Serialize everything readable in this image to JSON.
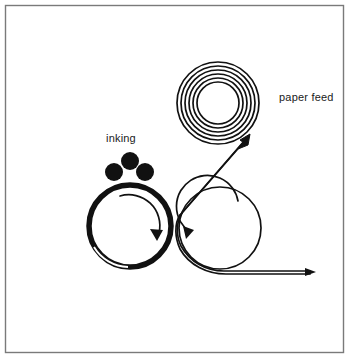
{
  "figure": {
    "background_color": "#ffffff",
    "ink_color": "#111111",
    "border": {
      "name": "figure-border",
      "color": "#7a7a7a",
      "inset_px": 5,
      "stroke_width": 1.4
    }
  },
  "labels": {
    "inking": "inking",
    "paper_feed": "paper feed"
  },
  "label_positions": {
    "inking": {
      "x": 106,
      "y": 142
    },
    "paper_feed": {
      "x": 279,
      "y": 101
    }
  },
  "components": {
    "paper_roll": {
      "name": "paper-roll",
      "center": {
        "x": 218,
        "y": 103
      },
      "outer_radius": 41,
      "inner_radius": 21,
      "turns": 6,
      "stroke_width": 1.6,
      "color": "#111111"
    },
    "plate_cylinder": {
      "name": "plate-cylinder",
      "center": {
        "x": 130,
        "y": 226
      },
      "radius": 41,
      "stroke_width": 5.5,
      "color": "#111111",
      "gap_sliver": {
        "start_deg": 150,
        "end_deg": 186
      }
    },
    "impression_cylinder": {
      "name": "impression-cylinder",
      "center": {
        "x": 220,
        "y": 228
      },
      "radius": 41,
      "stroke_width": 1.6,
      "color": "#111111"
    },
    "inking_rollers": {
      "name": "inking-rollers",
      "color": "#111111",
      "rollers": [
        {
          "label": "top-roller",
          "cx": 130,
          "cy": 161,
          "r": 9
        },
        {
          "label": "left-roller",
          "cx": 114,
          "cy": 172,
          "r": 9
        },
        {
          "label": "right-roller",
          "cx": 145,
          "cy": 172,
          "r": 9
        }
      ]
    },
    "rotation_arrows": [
      {
        "name": "plate-cylinder-rotation-arrow",
        "direction": "clockwise",
        "center": {
          "x": 130,
          "y": 226
        },
        "radius": 31,
        "start_deg": 250,
        "end_deg": 20
      },
      {
        "name": "impression-cylinder-rotation-arrow",
        "direction": "counter-clockwise",
        "center": {
          "x": 220,
          "y": 228
        },
        "radius": 31,
        "start_deg": 290,
        "end_deg": 175
      }
    ],
    "paper_web": {
      "name": "paper-web-path",
      "stroke_width": 1.6,
      "color": "#111111",
      "feed_arrow": {
        "x": 248,
        "y": 137,
        "angle_deg": -46
      },
      "exit_arrow": {
        "x": 310,
        "y": 272,
        "angle_deg": 0
      }
    }
  }
}
